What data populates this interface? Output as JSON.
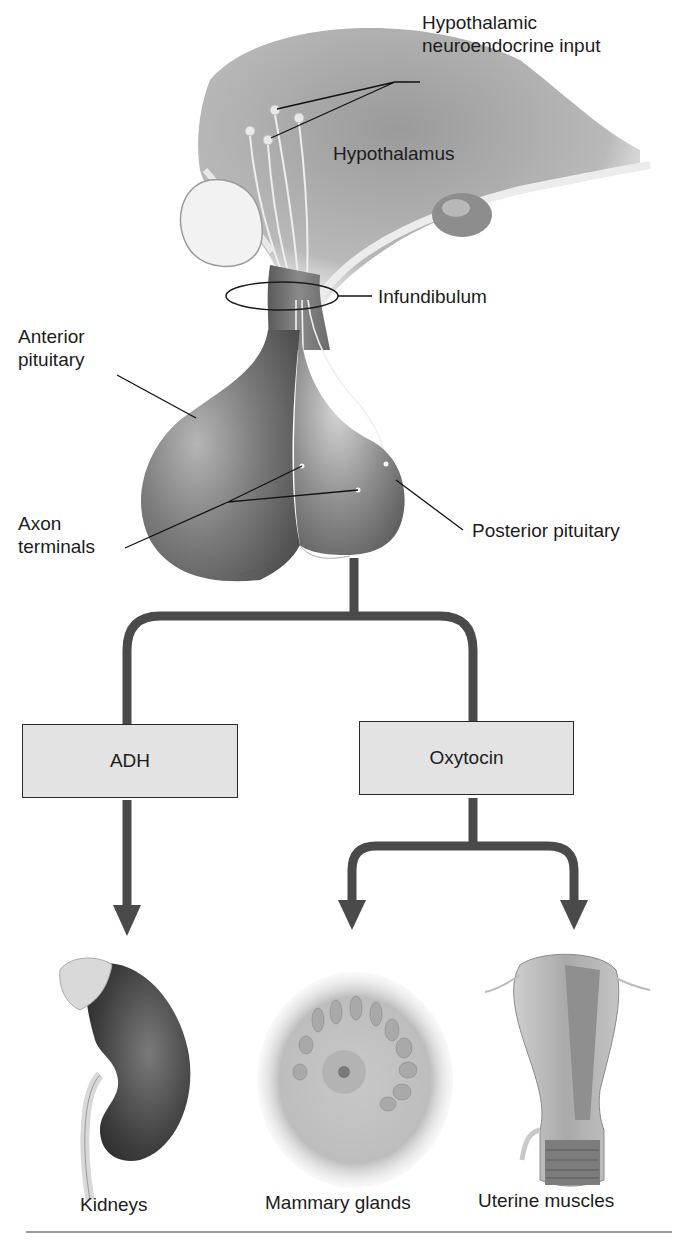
{
  "diagram": {
    "type": "anatomical flow diagram",
    "anatomy_labels": {
      "hypothalamic_input": [
        "Hypothalamic",
        "neuroendocrine input"
      ],
      "hypothalamus": "Hypothalamus",
      "infundibulum": "Infundibulum",
      "anterior_pituitary": [
        "Anterior",
        "pituitary"
      ],
      "axon_terminals": [
        "Axon",
        "terminals"
      ],
      "posterior_pituitary": "Posterior pituitary"
    },
    "hormones": [
      {
        "label": "ADH",
        "targets": [
          "Kidneys"
        ]
      },
      {
        "label": "Oxytocin",
        "targets": [
          "Mammary glands",
          "Uterine muscles"
        ]
      }
    ],
    "targets": [
      {
        "label": "Kidneys",
        "icon": "kidney-icon"
      },
      {
        "label": "Mammary glands",
        "icon": "mammary-gland-icon"
      },
      {
        "label": "Uterine muscles",
        "icon": "uterus-icon"
      }
    ],
    "colors": {
      "connector": "#4a4a4a",
      "box_fill": "#e3e3e3",
      "tissue_dark": "#5e5e5e",
      "tissue_light": "#d8d8d8",
      "background": "#ffffff"
    }
  }
}
